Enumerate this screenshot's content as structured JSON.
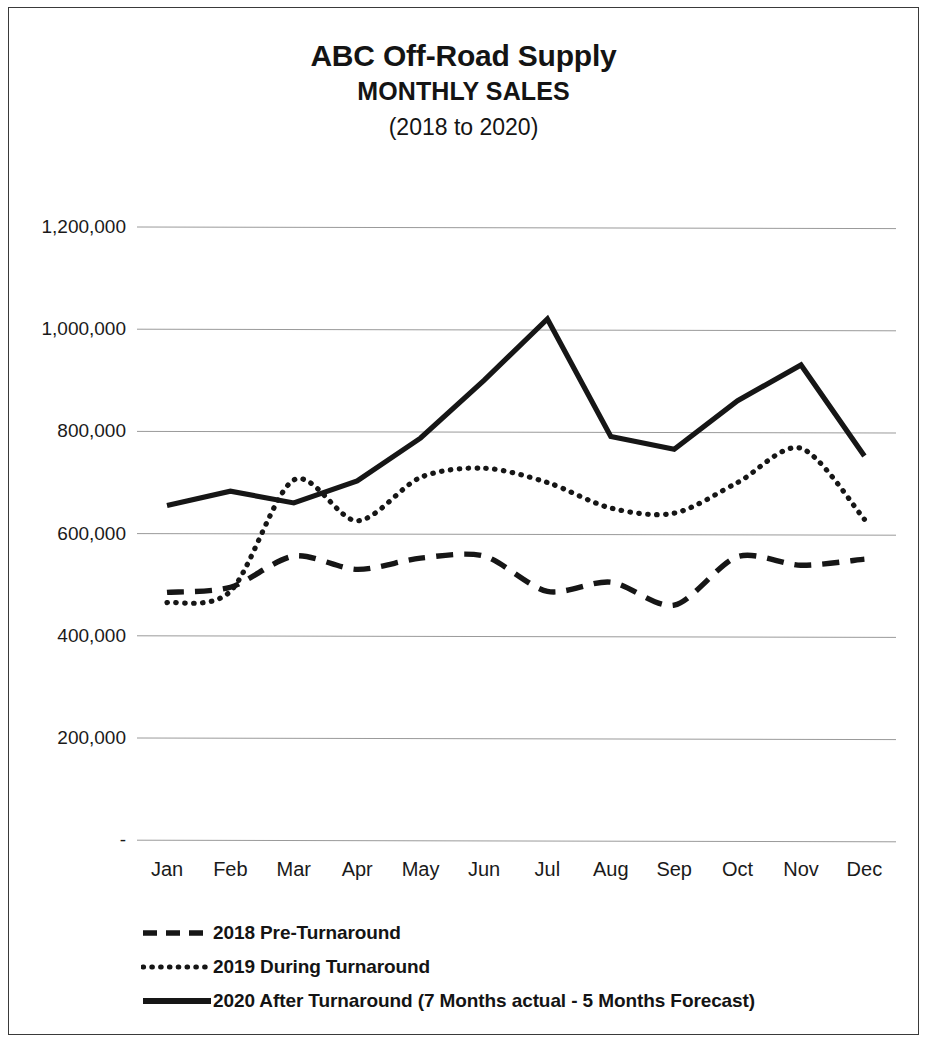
{
  "chart_data": {
    "type": "line",
    "title": "ABC Off-Road Supply",
    "subtitle": "MONTHLY SALES",
    "period": "(2018 to 2020)",
    "xlabel": "",
    "ylabel": "",
    "categories": [
      "Jan",
      "Feb",
      "Mar",
      "Apr",
      "May",
      "Jun",
      "Jul",
      "Aug",
      "Sep",
      "Oct",
      "Nov",
      "Dec"
    ],
    "ylim": [
      0,
      1200000
    ],
    "ytick_labels": [
      "1,200,000",
      "1,000,000",
      "800,000",
      "600,000",
      "400,000",
      "200,000",
      "-"
    ],
    "ytick_values": [
      1200000,
      1000000,
      800000,
      600000,
      400000,
      200000,
      0
    ],
    "grid": true,
    "legend_position": "bottom-left",
    "series": [
      {
        "name": "2018 Pre-Turnaround",
        "style": "dashed",
        "color": "#161616",
        "values": [
          485000,
          495000,
          556000,
          530000,
          552000,
          556000,
          487000,
          505000,
          460000,
          555000,
          538000,
          550000
        ]
      },
      {
        "name": "2019 During Turnaround",
        "style": "dotted",
        "color": "#161616",
        "values": [
          465000,
          487000,
          705000,
          625000,
          710000,
          728000,
          700000,
          650000,
          640000,
          700000,
          767000,
          628000
        ]
      },
      {
        "name": "2020 After Turnaround (7 Months actual - 5 Months Forecast)",
        "style": "solid",
        "color": "#161616",
        "values": [
          655000,
          683000,
          660000,
          703000,
          787000,
          900000,
          1020000,
          790000,
          765000,
          860000,
          930000,
          752000
        ]
      }
    ]
  },
  "legend": {
    "items": [
      {
        "label": "2018 Pre-Turnaround",
        "style": "dashed"
      },
      {
        "label": "2019 During Turnaround",
        "style": "dotted"
      },
      {
        "label": "2020 After Turnaround (7 Months actual - 5 Months Forecast)",
        "style": "solid"
      }
    ]
  },
  "colors": {
    "line": "#161616",
    "grid": "#9a9a9a",
    "border": "#3a3a3a",
    "text": "#141414"
  }
}
